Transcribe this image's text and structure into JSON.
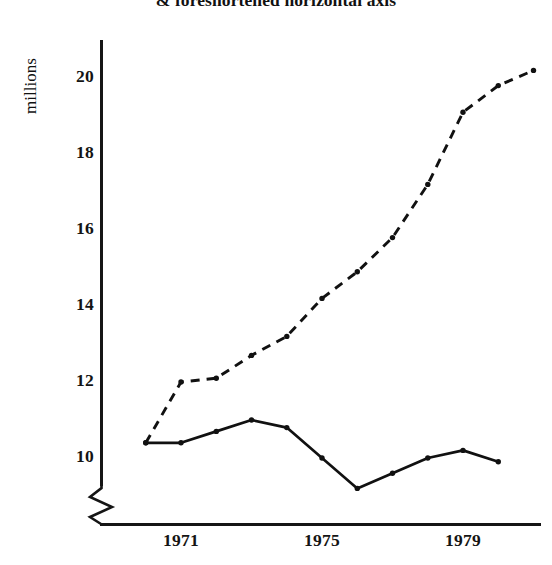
{
  "chart_data": {
    "type": "line",
    "title": "& foreshortened horizontal axis",
    "xlabel": "",
    "ylabel": "millions",
    "ylim": [
      9.0,
      20.6
    ],
    "xlim": [
      1970,
      1981
    ],
    "grid": false,
    "legend": "none",
    "axis_break": "y-axis zigzag break below 10",
    "y_ticks": [
      10,
      12,
      14,
      16,
      18,
      20
    ],
    "y_tick_labels": [
      "10",
      "12",
      "14",
      "16",
      "18",
      "20"
    ],
    "x_ticks": [
      1971,
      1975,
      1979
    ],
    "x_tick_labels": [
      "1971",
      "1975",
      "1979"
    ],
    "x": [
      1970,
      1971,
      1972,
      1973,
      1974,
      1975,
      1976,
      1977,
      1978,
      1979,
      1980,
      1981
    ],
    "series": [
      {
        "name": "dashed-series",
        "style": "dashed",
        "color": "#111111",
        "marker": "dot",
        "values": [
          10.4,
          12.0,
          12.1,
          12.7,
          13.2,
          14.2,
          14.9,
          15.8,
          17.2,
          19.1,
          19.8,
          20.2
        ]
      },
      {
        "name": "solid-series",
        "style": "solid",
        "color": "#111111",
        "marker": "dot",
        "values": [
          10.4,
          10.4,
          10.7,
          11.0,
          10.8,
          10.0,
          9.2,
          9.6,
          10.0,
          10.2,
          9.9,
          null
        ]
      }
    ]
  },
  "axis": {
    "y_label_text": "millions",
    "tick_10": "10",
    "tick_12": "12",
    "tick_14": "14",
    "tick_16": "16",
    "tick_18": "18",
    "tick_20": "20",
    "x_1971": "1971",
    "x_1975": "1975",
    "x_1979": "1979"
  },
  "title": {
    "text": "& foreshortened horizontal axis"
  }
}
